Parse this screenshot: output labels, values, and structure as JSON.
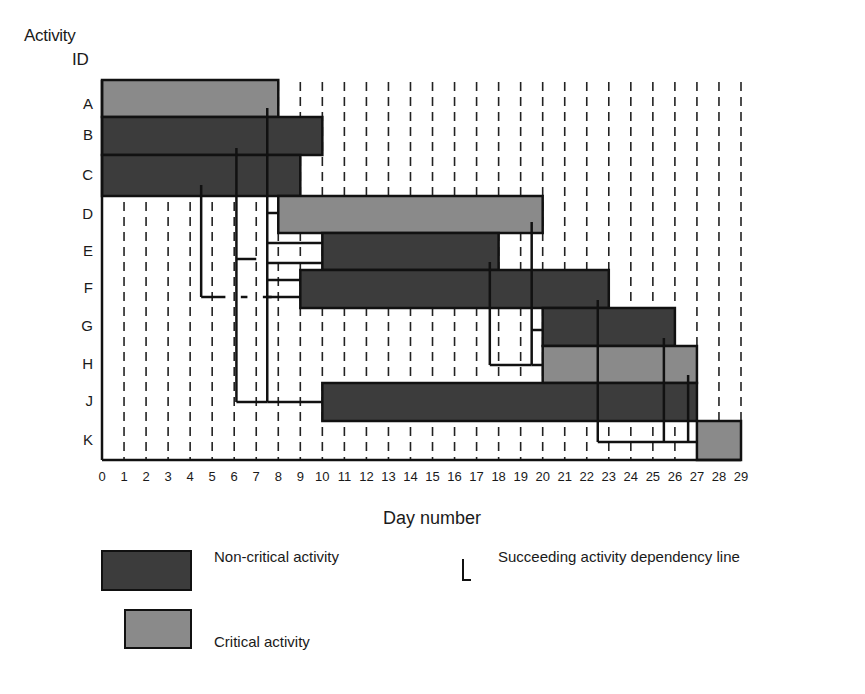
{
  "chart_data": {
    "type": "gantt",
    "title": "",
    "ylabel": "Activity ID",
    "xlabel": "Day number",
    "xlim": [
      0,
      29
    ],
    "x_ticks": [
      0,
      1,
      2,
      3,
      4,
      5,
      6,
      7,
      8,
      9,
      10,
      11,
      12,
      13,
      14,
      15,
      16,
      17,
      18,
      19,
      20,
      21,
      22,
      23,
      24,
      25,
      26,
      27,
      28,
      29
    ],
    "grid": "vertical dashed at each day",
    "categories": [
      "A",
      "B",
      "C",
      "D",
      "E",
      "F",
      "G",
      "H",
      "J",
      "K"
    ],
    "activities": [
      {
        "id": "A",
        "start": 0,
        "end": 8,
        "critical": true
      },
      {
        "id": "B",
        "start": 0,
        "end": 10,
        "critical": false
      },
      {
        "id": "C",
        "start": 0,
        "end": 9,
        "critical": false
      },
      {
        "id": "D",
        "start": 8,
        "end": 20,
        "critical": true
      },
      {
        "id": "E",
        "start": 10,
        "end": 18,
        "critical": false
      },
      {
        "id": "F",
        "start": 9,
        "end": 23,
        "critical": false
      },
      {
        "id": "G",
        "start": 20,
        "end": 26,
        "critical": false
      },
      {
        "id": "H",
        "start": 20,
        "end": 27,
        "critical": true
      },
      {
        "id": "J",
        "start": 10,
        "end": 27,
        "critical": false
      },
      {
        "id": "K",
        "start": 27,
        "end": 29,
        "critical": true
      }
    ],
    "dependency_lines": [
      {
        "from": "A",
        "x_day": 7.5,
        "to": [
          "D",
          "E",
          "F",
          "J"
        ]
      },
      {
        "from": "B",
        "x_day": 6.1,
        "to": [
          "E",
          "J"
        ]
      },
      {
        "from": "C",
        "x_day": 4.5,
        "to": [
          "F"
        ]
      },
      {
        "from": "D",
        "x_day": 19.5,
        "to": [
          "G",
          "H"
        ]
      },
      {
        "from": "E",
        "x_day": 17.6,
        "to": [
          "H"
        ]
      },
      {
        "from": "F",
        "x_day": 22.5,
        "to": [
          "K"
        ]
      },
      {
        "from": "G",
        "x_day": 25.5,
        "to": [
          "K"
        ]
      },
      {
        "from": "H",
        "x_day": 26.6,
        "to": [
          "K"
        ]
      }
    ],
    "legend": [
      {
        "label": "Non-critical activity",
        "color": "#3c3c3c"
      },
      {
        "label": "Critical activity",
        "color": "#8a8a8a"
      },
      {
        "label": "Succeeding activity dependency line",
        "symbol": "L"
      }
    ],
    "legend_position": "bottom"
  },
  "labels": {
    "y_title_line1": "Activity",
    "y_title_line2": "ID",
    "x_title": "Day number"
  },
  "legend": {
    "noncritical": "Non-critical activity",
    "critical": "Critical activity",
    "dependency": "Succeeding activity dependency line"
  },
  "colors": {
    "critical": "#8a8a8a",
    "noncritical": "#3c3c3c",
    "line": "#111111"
  }
}
